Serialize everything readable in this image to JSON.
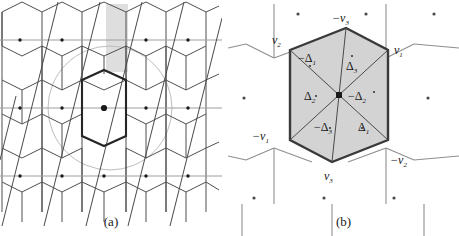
{
  "figure": {
    "panel_a": {
      "caption": "(a)",
      "description": "hexagonal honeycomb lattice with bold central Wigner-Seitz hexagon, inscribed circle, horizontal lattice lines, steep diagonal lattice lines, lattice point dots and a vertical shaded band"
    },
    "panel_b": {
      "caption": "(b)",
      "description": "shaded hexagonal fundamental domain subdivided into six triangles by diagonals from the central lattice point, with vertex and triangle labels",
      "vertex_labels": [
        {
          "id": "v2-top-left",
          "text": "v",
          "sub": "2",
          "sign": ""
        },
        {
          "id": "v3-neg-top",
          "text": "v",
          "sub": "3",
          "sign": "−"
        },
        {
          "id": "v1-top-right",
          "text": "v",
          "sub": "1",
          "sign": ""
        },
        {
          "id": "v1-neg-bottom-left",
          "text": "v",
          "sub": "1",
          "sign": "−"
        },
        {
          "id": "v3-bottom",
          "text": "v",
          "sub": "3",
          "sign": ""
        },
        {
          "id": "v2-neg-bottom-right",
          "text": "v",
          "sub": "2",
          "sign": "−"
        }
      ],
      "triangle_labels": [
        {
          "id": "delta1-neg-upper-left",
          "text": "Δ",
          "sub": "1",
          "sign": "−"
        },
        {
          "id": "delta3-upper-right",
          "text": "Δ",
          "sub": "3",
          "sign": ""
        },
        {
          "id": "delta2-left",
          "text": "Δ",
          "sub": "2",
          "sign": ""
        },
        {
          "id": "delta2-neg-right",
          "text": "Δ",
          "sub": "2",
          "sign": "−"
        },
        {
          "id": "delta3-neg-lower-left",
          "text": "Δ",
          "sub": "3",
          "sign": "−"
        },
        {
          "id": "delta1-lower-right",
          "text": "Δ",
          "sub": "1",
          "sign": ""
        }
      ]
    },
    "colors": {
      "background": "#ffffff",
      "lattice_line": "#4a4a4a",
      "lattice_line_light": "#9a9a9a",
      "bold_hex": "#2a2a2a",
      "circle": "#b8b8b8",
      "band_fill": "#dedede",
      "cell_fill": "#d3d3d3",
      "cell_stroke": "#3a3a3a",
      "dot": "#1a1a1a",
      "text": "#161616"
    }
  }
}
